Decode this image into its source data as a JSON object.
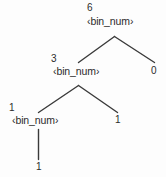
{
  "diagram": {
    "kind": "parse-tree",
    "background_color": "#fdfdfd",
    "stroke_color": "#3a3a3a",
    "text_color": "#2b2b2b",
    "nodes": {
      "root": {
        "annotation": "6",
        "symbol": "‹bin_num›"
      },
      "level2_left": {
        "annotation": "3",
        "symbol": "‹bin_num›"
      },
      "level2_right": {
        "symbol": "0"
      },
      "level3_left": {
        "annotation": "1",
        "symbol": "‹bin_num›"
      },
      "level3_right": {
        "symbol": "1"
      },
      "level4_leaf": {
        "symbol": "1"
      }
    }
  }
}
